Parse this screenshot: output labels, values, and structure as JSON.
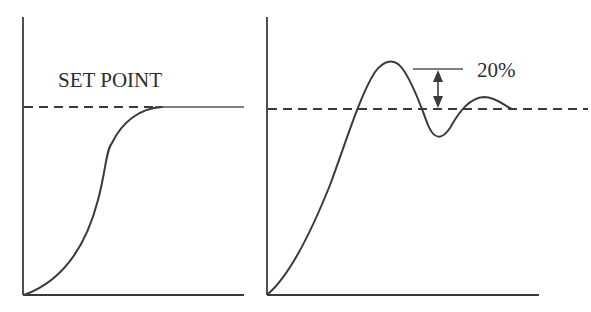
{
  "diagram": {
    "left_panel": {
      "title": "Smooth (critically damped) response",
      "setpoint_label": "SET POINT"
    },
    "right_panel": {
      "title": "Underdamped response with overshoot",
      "overshoot_label": "20%"
    },
    "colors": {
      "line": "#3a3a3a",
      "text": "#2e2e2e",
      "background": "#ffffff"
    }
  }
}
